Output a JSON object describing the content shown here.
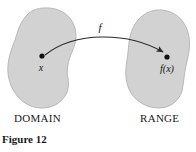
{
  "figure": {
    "caption": "Figure 12",
    "background_color": "#ffffff",
    "blob_fill_color": "#d2d2d2",
    "blob_stroke_color": "#b8b8b8",
    "ink_color": "#1a1a1a"
  },
  "sets": {
    "domain": {
      "label": "DOMAIN",
      "point_label": "x",
      "point_x": 42,
      "point_y": 56
    },
    "range": {
      "label": "RANGE",
      "point_label": "f(x)",
      "point_x": 167,
      "point_y": 57
    }
  },
  "mapping": {
    "arrow_label": "f",
    "arrow_label_x": 100,
    "arrow_label_y": 31
  },
  "chart_data": {
    "type": "diagram",
    "title": "Figure 12",
    "nodes": [
      {
        "id": "x",
        "label": "x",
        "set": "DOMAIN",
        "x": 42,
        "y": 56
      },
      {
        "id": "fx",
        "label": "f(x)",
        "set": "RANGE",
        "x": 167,
        "y": 57
      }
    ],
    "edges": [
      {
        "from": "x",
        "to": "fx",
        "label": "f",
        "style": "curved-arrow"
      }
    ],
    "regions": [
      {
        "label": "DOMAIN",
        "shape": "blob",
        "bbox": [
          8,
          8,
          78,
          108
        ]
      },
      {
        "label": "RANGE",
        "shape": "blob",
        "bbox": [
          126,
          10,
          190,
          108
        ]
      }
    ]
  }
}
